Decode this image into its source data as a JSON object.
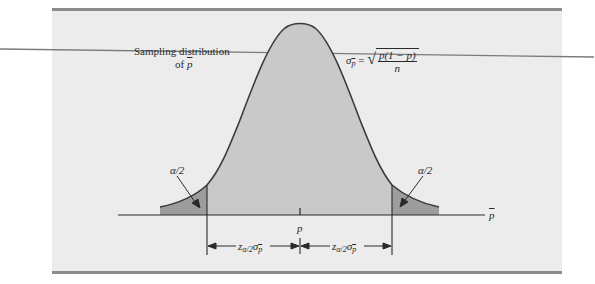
{
  "figure": {
    "title_line1": "Sampling distribution",
    "title_line2_prefix": "of ",
    "title_line2_var": "p",
    "formula": {
      "lhs_symbol": "σ",
      "lhs_sub": "p",
      "equals": "=",
      "sqrt_symbol": "√",
      "numerator": "p(1 − p)",
      "denominator": "n"
    },
    "left_tail_label": "α/2",
    "right_tail_label": "α/2",
    "center_label": "p",
    "axis_label": "p",
    "left_interval_label": {
      "z": "z",
      "z_sub": "α/2",
      "sigma": "σ",
      "sigma_sub": "p"
    },
    "right_interval_label": {
      "z": "z",
      "z_sub": "α/2",
      "sigma": "σ",
      "sigma_sub": "p"
    },
    "colors": {
      "panel_bg": "#ececec",
      "rule": "#8c8c8c",
      "body_fill": "#c9c9c9",
      "tail_fill": "#9d9d9d",
      "curve": "#3a3a3a",
      "text": "#2a2a2a"
    }
  }
}
